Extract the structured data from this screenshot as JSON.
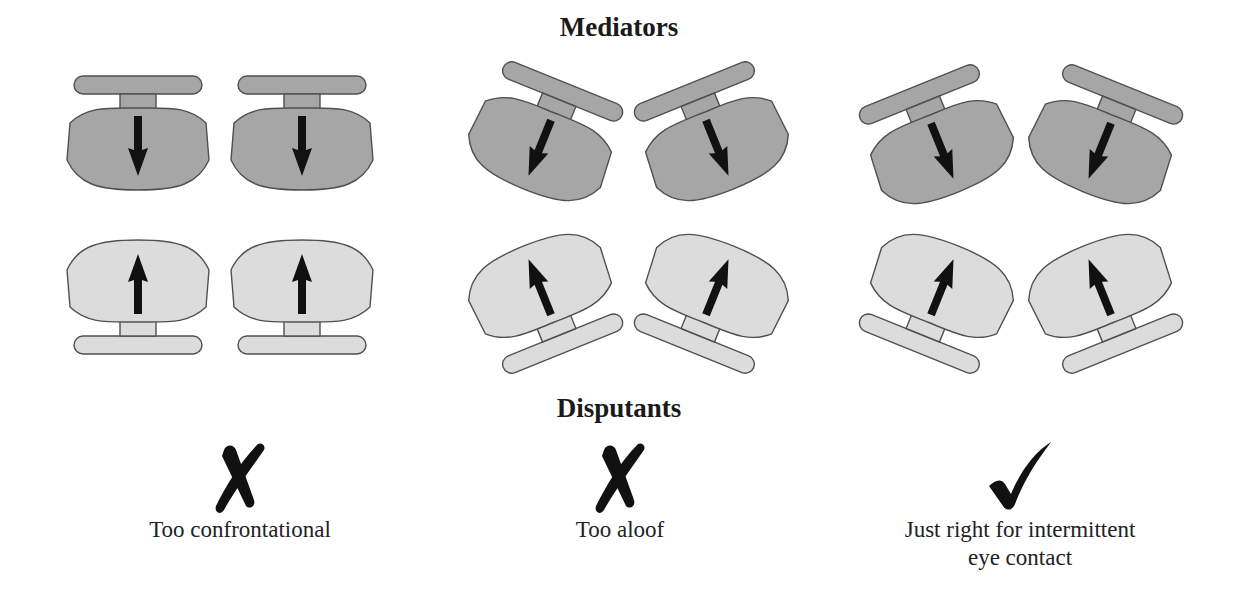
{
  "headings": {
    "top": "Mediators",
    "bottom": "Disputants"
  },
  "colors": {
    "mediator_fill": "#a6a6a6",
    "disputant_fill": "#dcdcdc",
    "outline": "#505050",
    "arrow": "#111111",
    "mark": "#111111"
  },
  "arrangements": [
    {
      "id": "confrontational",
      "verdict_icon": "cross-mark-icon",
      "verdict_symbol": "✗",
      "caption": "Too confrontational",
      "correct": false,
      "chairs": [
        {
          "role": "mediator",
          "cx": 138,
          "cy": 132,
          "angle": 0
        },
        {
          "role": "mediator",
          "cx": 302,
          "cy": 132,
          "angle": 0
        },
        {
          "role": "disputant",
          "cx": 138,
          "cy": 298,
          "angle": 0
        },
        {
          "role": "disputant",
          "cx": 302,
          "cy": 298,
          "angle": 0
        }
      ]
    },
    {
      "id": "aloof",
      "verdict_icon": "cross-mark-icon",
      "verdict_symbol": "✗",
      "caption": "Too aloof",
      "correct": false,
      "chairs": [
        {
          "role": "mediator",
          "cx": 545,
          "cy": 135,
          "angle": 22
        },
        {
          "role": "mediator",
          "cx": 712,
          "cy": 135,
          "angle": -22
        },
        {
          "role": "disputant",
          "cx": 545,
          "cy": 300,
          "angle": -22
        },
        {
          "role": "disputant",
          "cx": 712,
          "cy": 300,
          "angle": 22
        }
      ]
    },
    {
      "id": "intermittent",
      "verdict_icon": "check-mark-icon",
      "verdict_symbol": "✓",
      "caption": "Just right for intermittent\neye contact",
      "correct": true,
      "chairs": [
        {
          "role": "mediator",
          "cx": 937,
          "cy": 138,
          "angle": -22
        },
        {
          "role": "mediator",
          "cx": 1105,
          "cy": 138,
          "angle": 22
        },
        {
          "role": "disputant",
          "cx": 937,
          "cy": 300,
          "angle": 22
        },
        {
          "role": "disputant",
          "cx": 1105,
          "cy": 300,
          "angle": -22
        }
      ]
    }
  ]
}
